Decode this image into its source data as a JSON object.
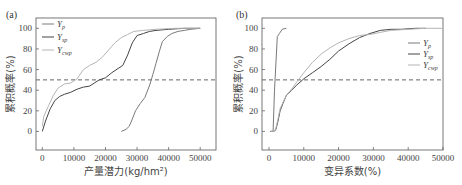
{
  "chart_data": [
    {
      "type": "line",
      "panel_label": "(a)",
      "title": "",
      "xlabel": "产量潜力(kg/hm²)",
      "ylabel": "累积概率(%)",
      "xlim": [
        -2000,
        55000
      ],
      "ylim": [
        -18,
        110
      ],
      "xticks": [
        0,
        10000,
        20000,
        30000,
        40000,
        50000
      ],
      "xtick_labels": [
        "0",
        "10000",
        "20000",
        "30000",
        "40000",
        "50000"
      ],
      "yticks": [
        0,
        20,
        40,
        60,
        80,
        100
      ],
      "ytick_labels": [
        "0",
        "20",
        "40",
        "60",
        "80",
        "100"
      ],
      "legend_position": "top-left",
      "reference_line": {
        "y": 50,
        "style": "dashed",
        "color": "#666666"
      },
      "series": [
        {
          "name": "Y_p",
          "label_main": "Y",
          "label_sub": "p",
          "color": "#7a7a7a",
          "x": [
            25000,
            26500,
            27500,
            28500,
            29500,
            31000,
            32500,
            34000,
            35000,
            36000,
            37000,
            38000,
            39500,
            41000,
            43000,
            45000,
            47000,
            50000
          ],
          "y": [
            0,
            2,
            5,
            12,
            20,
            27,
            33,
            45,
            55,
            66,
            77,
            87,
            92,
            95,
            97,
            98,
            99,
            100
          ]
        },
        {
          "name": "Y_sp",
          "label_main": "Y",
          "label_sub": "sp",
          "color": "#444444",
          "x": [
            0,
            1000,
            2500,
            4000,
            5500,
            7000,
            9000,
            11000,
            13000,
            15000,
            16500,
            18000,
            20000,
            22000,
            24000,
            25500,
            27000,
            28500,
            30000,
            32000,
            34000,
            36000,
            40000,
            45000,
            50000
          ],
          "y": [
            0,
            10,
            22,
            30,
            34,
            36,
            38,
            41,
            43,
            44,
            47,
            50,
            52,
            57,
            61,
            64,
            74,
            86,
            93,
            95,
            97,
            98,
            99,
            100,
            100
          ]
        },
        {
          "name": "Y_cwp",
          "label_main": "Y",
          "label_sub": "cwp",
          "color": "#b5b5b5",
          "x": [
            0,
            500,
            2000,
            3500,
            5000,
            7000,
            9000,
            11000,
            13000,
            15000,
            17000,
            19000,
            21000,
            23000,
            25000,
            27000,
            29000,
            32000,
            36000,
            42000,
            50000
          ],
          "y": [
            5,
            15,
            25,
            35,
            42,
            46,
            47,
            51,
            60,
            64,
            67,
            72,
            79,
            86,
            91,
            94,
            97,
            98,
            99,
            100,
            100
          ]
        }
      ]
    },
    {
      "type": "line",
      "panel_label": "(b)",
      "title": "",
      "xlabel": "变异系数(%)",
      "ylabel": "累积概率(%)",
      "xlim": [
        -2000,
        50000
      ],
      "ylim": [
        -18,
        110
      ],
      "xticks": [
        0,
        10000,
        20000,
        30000,
        40000,
        50000
      ],
      "xtick_labels": [
        "0",
        "10000",
        "20000",
        "30000",
        "40000",
        "50000"
      ],
      "yticks": [
        0,
        20,
        40,
        60,
        80,
        100
      ],
      "ytick_labels": [
        "0",
        "20",
        "40",
        "60",
        "80",
        "100"
      ],
      "legend_position": "right",
      "reference_line": {
        "y": 50,
        "style": "dashed",
        "color": "#666666"
      },
      "series": [
        {
          "name": "Y_p",
          "label_main": "Y",
          "label_sub": "p",
          "color": "#7a7a7a",
          "x": [
            300,
            1200,
            1600,
            2400,
            3000,
            3800,
            5000
          ],
          "y": [
            0,
            0,
            40,
            92,
            95,
            99,
            100
          ]
        },
        {
          "name": "Y_sp",
          "label_main": "Y",
          "label_sub": "sp",
          "color": "#444444",
          "x": [
            500,
            1500,
            2000,
            2600,
            3200,
            4000,
            5000,
            6500,
            8000,
            10000,
            12500,
            15000,
            17500,
            20000,
            23000,
            26000,
            29000,
            32000,
            35000,
            38000,
            42000,
            45000
          ],
          "y": [
            0,
            0,
            2,
            10,
            20,
            27,
            35,
            40,
            45,
            51,
            57,
            63,
            70,
            78,
            85,
            91,
            95,
            98,
            99,
            99,
            100,
            100
          ]
        },
        {
          "name": "Y_cwp",
          "label_main": "Y",
          "label_sub": "cwp",
          "color": "#b5b5b5",
          "x": [
            500,
            1500,
            2000,
            2600,
            3200,
            4000,
            5000,
            6500,
            8000,
            10000,
            12500,
            15000,
            17500,
            20000,
            23000,
            26000,
            29000,
            32000,
            35000,
            40000,
            45000,
            50000
          ],
          "y": [
            0,
            0,
            3,
            12,
            22,
            28,
            35,
            41,
            48,
            57,
            67,
            75,
            81,
            86,
            90,
            93,
            94,
            96,
            98,
            99,
            100,
            100
          ]
        }
      ]
    }
  ]
}
